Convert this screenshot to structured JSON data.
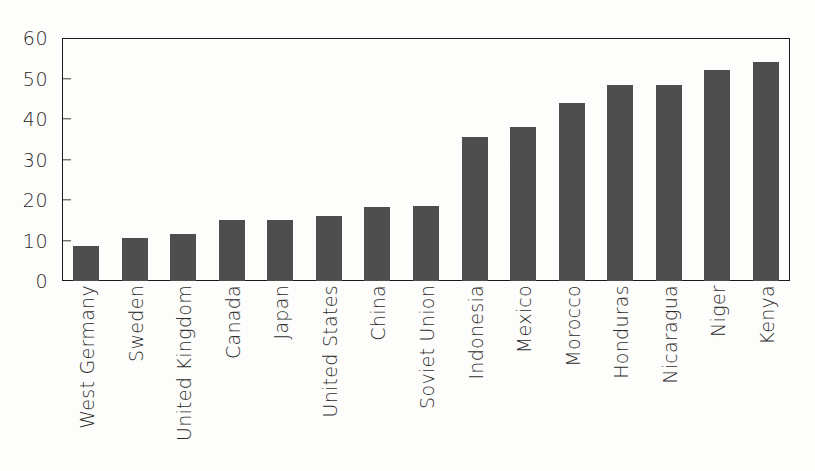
{
  "chart_data": {
    "type": "bar",
    "title": "",
    "xlabel": "",
    "ylabel": "",
    "ylim": [
      0,
      60
    ],
    "ytick_labels": [
      "60",
      "50",
      "40",
      "30",
      "20",
      "10",
      "0"
    ],
    "yticks": [
      60,
      50,
      40,
      30,
      20,
      10,
      0
    ],
    "grid": false,
    "legend": null,
    "bar_color": "#4e4e4e",
    "axis_color": "#1a1a1a",
    "background_color": "#fdfdfb",
    "categories": [
      "West Germany",
      "Sweden",
      "United Kingdom",
      "Canada",
      "Japan",
      "United States",
      "China",
      "Soviet Union",
      "Indonesia",
      "Mexico",
      "Morocco",
      "Honduras",
      "Nicaragua",
      "Niger",
      "Kenya"
    ],
    "values": [
      8.7,
      10.5,
      11.5,
      15,
      15,
      16,
      18.3,
      18.5,
      35.5,
      38,
      44,
      48.3,
      48.3,
      52,
      54
    ]
  }
}
